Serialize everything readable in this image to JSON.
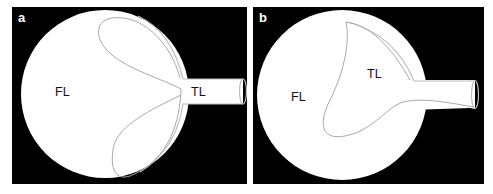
{
  "figure": {
    "colors": {
      "background": "#000000",
      "vessel": "#ffffff",
      "contour": "#a8a8a8",
      "label_text": "#111111",
      "panel_letter": "#ffffff"
    },
    "panels": [
      {
        "id": "a",
        "letter": "a",
        "labels": {
          "false_lumen": "FL",
          "true_lumen": "TL"
        }
      },
      {
        "id": "b",
        "letter": "b",
        "labels": {
          "false_lumen": "FL",
          "true_lumen": "TL"
        }
      }
    ]
  }
}
